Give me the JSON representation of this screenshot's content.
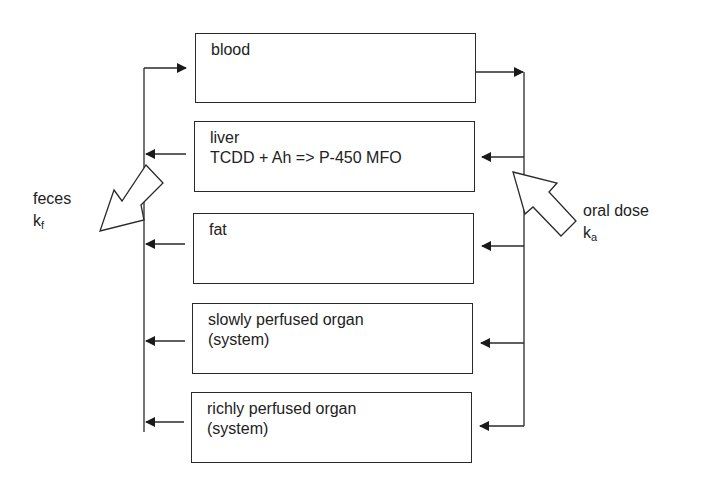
{
  "diagram": {
    "type": "pbpk-compartment-model",
    "compartments": [
      {
        "id": "blood",
        "label": "blood"
      },
      {
        "id": "liver",
        "label": "liver\nTCDD + Ah => P-450 MFO"
      },
      {
        "id": "fat",
        "label": "fat"
      },
      {
        "id": "slowly",
        "label": "slowly perfused organ\n(system)"
      },
      {
        "id": "richly",
        "label": "richly perfused organ\n(system)"
      }
    ],
    "inputs": {
      "oral_dose": {
        "label": "oral dose",
        "rate_symbol": "k",
        "rate_subscript": "a"
      }
    },
    "outputs": {
      "feces": {
        "label": "feces",
        "rate_symbol": "k",
        "rate_subscript": "f"
      }
    },
    "flows": [
      {
        "from": "blood",
        "to": "arterial-line",
        "side": "right"
      },
      {
        "from": "arterial-line",
        "to": "liver"
      },
      {
        "from": "arterial-line",
        "to": "fat"
      },
      {
        "from": "arterial-line",
        "to": "slowly"
      },
      {
        "from": "arterial-line",
        "to": "richly"
      },
      {
        "from": "liver",
        "to": "venous-line"
      },
      {
        "from": "fat",
        "to": "venous-line"
      },
      {
        "from": "slowly",
        "to": "venous-line"
      },
      {
        "from": "richly",
        "to": "venous-line"
      },
      {
        "from": "venous-line",
        "to": "blood",
        "side": "left"
      }
    ],
    "colors": {
      "stroke": "#2a2a2a",
      "background": "#ffffff"
    }
  }
}
